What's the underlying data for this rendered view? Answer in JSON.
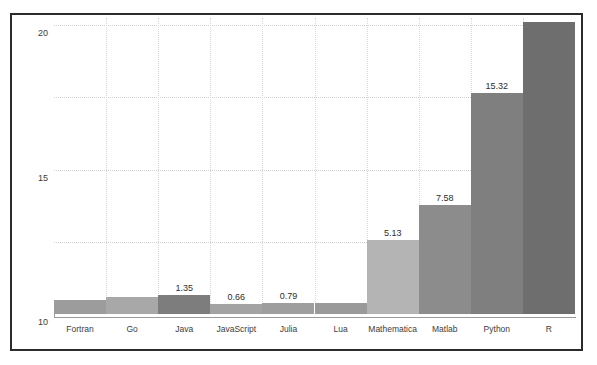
{
  "figure": {
    "background_color": "#ffffff",
    "frame_color": "#2b2b2b",
    "axis_color": "#9a9a9a",
    "grid_color": "#cfcfcf"
  },
  "chart_data": {
    "type": "bar",
    "title": "",
    "xlabel": "",
    "ylabel": "speed relative to C",
    "ylim": [
      0,
      20.5
    ],
    "yticks": [
      0,
      5,
      10,
      15,
      20
    ],
    "ytick_labels": [
      "0",
      "5",
      "10",
      "15",
      "20"
    ],
    "grid": true,
    "grid_axis": "both",
    "legend": false,
    "categories": [
      "Fortran",
      "Go",
      "Java",
      "JavaScript",
      "Julia",
      "Lua",
      "Mathematica",
      "Matlab",
      "Python",
      "R"
    ],
    "values": [
      1.0,
      1.2,
      1.35,
      0.66,
      0.79,
      0.75,
      5.13,
      7.58,
      15.32,
      20.2
    ],
    "value_labels": [
      "",
      "",
      "1.35",
      "0.66",
      "0.79",
      "",
      "5.13",
      "7.58",
      "15.32",
      ""
    ],
    "bar_colors": [
      "#9c9c9c",
      "#a8a8a8",
      "#7d7d7d",
      "#a3a3a3",
      "#9e9e9e",
      "#9a9a9a",
      "#b4b4b4",
      "#8c8c8c",
      "#7f7f7f",
      "#6e6e6e"
    ]
  }
}
